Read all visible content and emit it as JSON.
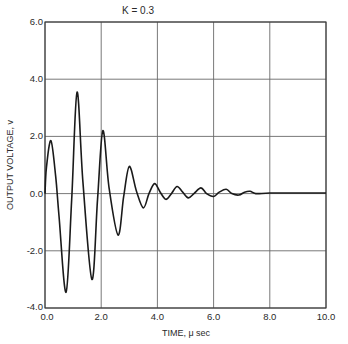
{
  "chart_data": {
    "type": "line",
    "title": "K = 0.3",
    "xlabel": "TIME, μ sec",
    "ylabel": "OUTPUT VOLTAGE, v",
    "xlim": [
      0,
      10
    ],
    "ylim": [
      -4,
      6
    ],
    "grid": true,
    "legend": null,
    "x_ticks": [
      "0.0",
      "2.0",
      "4.0",
      "6.0",
      "8.0",
      "10.0"
    ],
    "y_ticks": [
      "-4.0",
      "-2.0",
      "0.0",
      "2.0",
      "4.0",
      "6.0"
    ],
    "x_tick_values": [
      0,
      2,
      4,
      6,
      8,
      10
    ],
    "y_tick_values": [
      -4,
      -2,
      0,
      2,
      4,
      6
    ],
    "series": [
      {
        "name": "output voltage",
        "x": [
          0.0,
          0.05,
          0.21,
          0.38,
          0.5,
          0.75,
          0.95,
          1.14,
          1.35,
          1.67,
          1.87,
          2.06,
          2.28,
          2.6,
          2.8,
          3.0,
          3.25,
          3.5,
          3.7,
          3.9,
          4.1,
          4.3,
          4.5,
          4.7,
          4.9,
          5.1,
          5.3,
          5.55,
          5.75,
          6.0,
          6.2,
          6.45,
          6.65,
          6.9,
          7.1,
          7.3,
          7.5,
          8.0,
          9.0,
          10.0
        ],
        "y": [
          0.0,
          0.9,
          1.85,
          0.6,
          -0.8,
          -3.45,
          -0.2,
          3.55,
          0.4,
          -3.0,
          -0.2,
          2.2,
          0.2,
          -1.45,
          -0.1,
          0.95,
          0.1,
          -0.5,
          0.0,
          0.35,
          0.05,
          -0.2,
          0.0,
          0.25,
          0.05,
          -0.15,
          0.0,
          0.2,
          0.0,
          -0.1,
          0.05,
          0.15,
          0.0,
          -0.05,
          0.05,
          0.08,
          0.0,
          0.02,
          0.02,
          0.02
        ]
      }
    ]
  }
}
